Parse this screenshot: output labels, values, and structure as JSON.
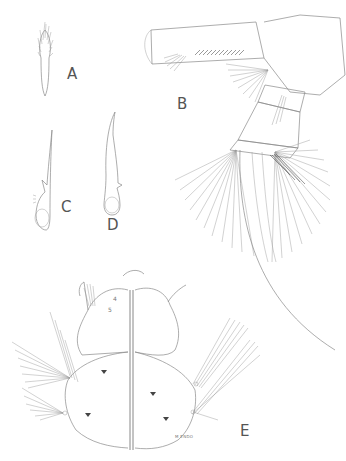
{
  "plate": {
    "figures": [
      {
        "id": "A",
        "label": "A"
      },
      {
        "id": "B",
        "label": "B"
      },
      {
        "id": "C",
        "label": "C"
      },
      {
        "id": "D",
        "label": "D"
      },
      {
        "id": "E",
        "label": "E"
      }
    ],
    "annotations": {
      "seta_number_4": "4",
      "seta_number_5": "5"
    },
    "signature": "M ENDO"
  }
}
